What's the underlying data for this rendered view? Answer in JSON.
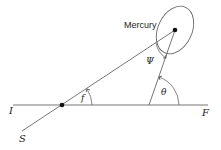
{
  "diagram": {
    "title_label": "Mercury",
    "labels": {
      "initial": "I",
      "final": "F",
      "sun_direction": "S",
      "elongation_angle": "f",
      "phase_angle": "Ψ",
      "theta_angle": "θ"
    },
    "colors": {
      "line": "#555555",
      "dot": "#111111",
      "text": "#222222"
    }
  }
}
